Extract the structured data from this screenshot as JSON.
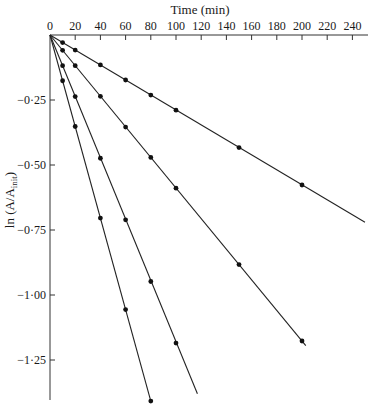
{
  "chart_data": {
    "type": "line",
    "title": "",
    "xlabel": "Time (min)",
    "ylabel": "ln (A/A_init)",
    "ylabel_main": "ln (A/A",
    "ylabel_sub": "init",
    "ylabel_close": ")",
    "xlim": [
      0,
      250
    ],
    "ylim": [
      -1.42,
      0
    ],
    "x_axis_position": "top",
    "grid": false,
    "legend": null,
    "x_ticks": [
      0,
      20,
      40,
      60,
      80,
      100,
      120,
      140,
      160,
      180,
      200,
      220,
      240
    ],
    "x_tick_labels": [
      "0",
      "20",
      "40",
      "60",
      "80",
      "100",
      "120",
      "140",
      "160",
      "180",
      "200",
      "220",
      "240"
    ],
    "y_ticks": [
      -0.25,
      -0.5,
      -0.75,
      -1.0,
      -1.25
    ],
    "y_tick_labels": [
      "−0·25",
      "−0·50",
      "−0·75",
      "−1·00",
      "−1·25"
    ],
    "series": [
      {
        "name": "series-1",
        "x": [
          0,
          10,
          20,
          40,
          60,
          80,
          100,
          150,
          200
        ],
        "y": [
          0,
          -0.029,
          -0.058,
          -0.115,
          -0.173,
          -0.231,
          -0.289,
          -0.433,
          -0.577
        ],
        "line_end": [
          250,
          -0.72
        ]
      },
      {
        "name": "series-2",
        "x": [
          0,
          10,
          20,
          40,
          60,
          80,
          100,
          150,
          200
        ],
        "y": [
          0,
          -0.059,
          -0.118,
          -0.236,
          -0.354,
          -0.471,
          -0.589,
          -0.883,
          -1.177
        ],
        "line_end": [
          203,
          -1.195
        ]
      },
      {
        "name": "series-3",
        "x": [
          0,
          10,
          20,
          40,
          60,
          80,
          100
        ],
        "y": [
          0,
          -0.118,
          -0.237,
          -0.474,
          -0.711,
          -0.948,
          -1.185
        ],
        "line_end": [
          117,
          -1.38
        ]
      },
      {
        "name": "series-4",
        "x": [
          0,
          10,
          20,
          40,
          60,
          80
        ],
        "y": [
          0,
          -0.176,
          -0.352,
          -0.704,
          -1.056,
          -1.408
        ],
        "line_end": [
          80,
          -1.408
        ]
      }
    ]
  }
}
